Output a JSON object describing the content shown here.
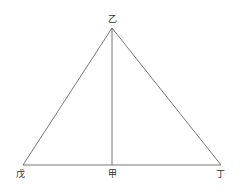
{
  "diagram": {
    "type": "geometry",
    "stroke_color": "#555555",
    "background": "#ffffff",
    "points": {
      "apex": {
        "label": "乙",
        "x": 112,
        "y": 28,
        "label_x": 112,
        "label_y": 19
      },
      "foot": {
        "label": "甲",
        "x": 112,
        "y": 165,
        "label_x": 112,
        "label_y": 174
      },
      "left": {
        "label": "戊",
        "x": 23,
        "y": 165,
        "label_x": 20,
        "label_y": 174
      },
      "right": {
        "label": "丁",
        "x": 221,
        "y": 165,
        "label_x": 220,
        "label_y": 174
      }
    },
    "segments": [
      [
        "left",
        "apex"
      ],
      [
        "apex",
        "right"
      ],
      [
        "left",
        "right"
      ],
      [
        "apex",
        "foot"
      ]
    ]
  }
}
